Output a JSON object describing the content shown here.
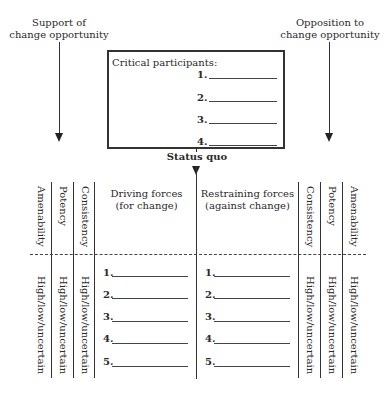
{
  "labels": {
    "support_line1": "Support of",
    "support_line2": "change opportunity",
    "opposition_line1": "Opposition to",
    "opposition_line2": "change opportunity",
    "status_quo": "Status quo"
  },
  "participants_box": {
    "title": "Critical participants:",
    "items": [
      "1.",
      "2.",
      "3.",
      "4."
    ]
  },
  "left_columns": {
    "headers": [
      "Amenability",
      "Potency",
      "Consistency"
    ],
    "values": [
      "High/low/uncertain",
      "High/low/uncertain",
      "High/low/uncertain"
    ]
  },
  "right_columns": {
    "headers": [
      "Consistency",
      "Potency",
      "Amenability"
    ],
    "values": [
      "High/low/uncertain",
      "High/low/uncertain",
      "High/low/uncertain"
    ]
  },
  "driving": {
    "title_line1": "Driving forces",
    "title_line2": "(for change)",
    "items": [
      "1.",
      "2.",
      "3.",
      "4.",
      "5."
    ]
  },
  "restraining": {
    "title_line1": "Restraining forces",
    "title_line2": "(against change)",
    "items": [
      "1.",
      "2.",
      "3.",
      "4.",
      "5."
    ]
  }
}
